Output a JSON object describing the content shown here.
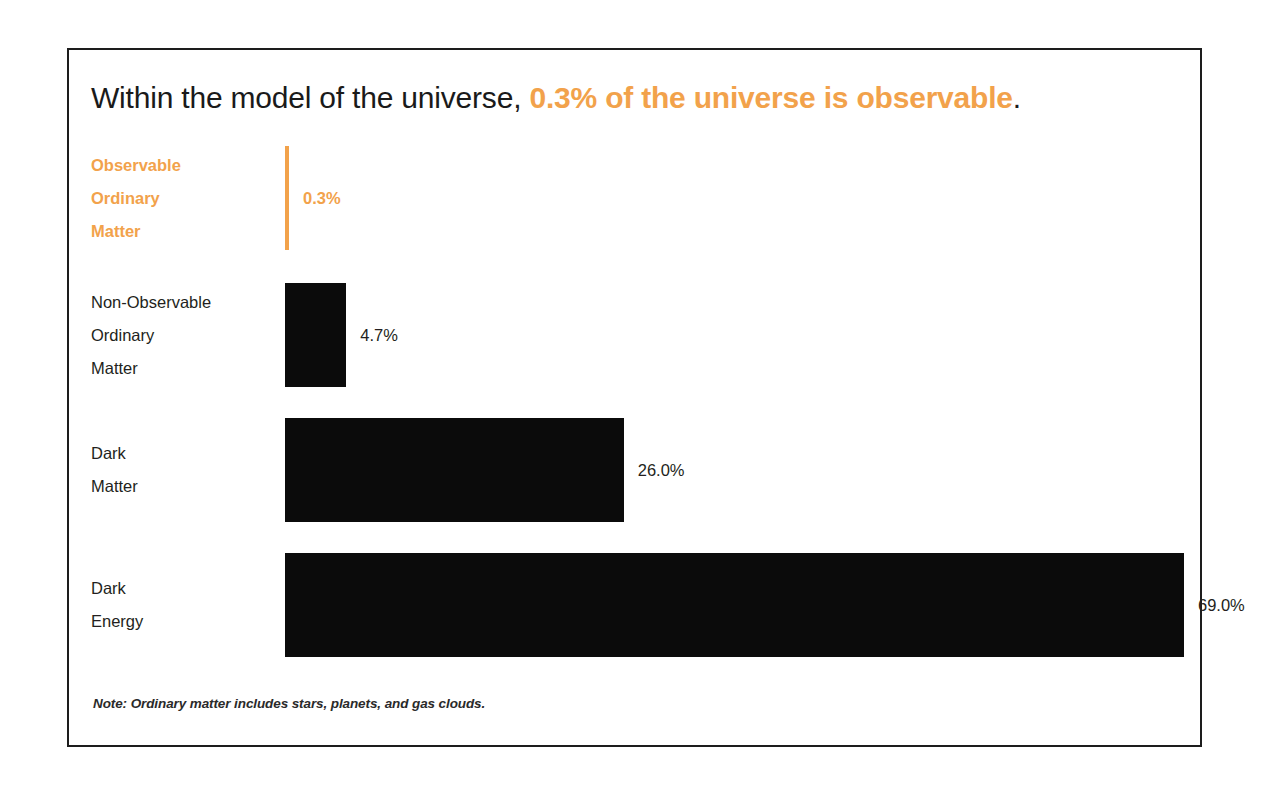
{
  "chart_data": {
    "type": "bar",
    "orientation": "horizontal",
    "title_plain": "Within the model of the universe, 0.3% of the universe is observable.",
    "title_parts": {
      "lead": "Within the model of the universe, ",
      "highlight": "0.3% of the universe is observable",
      "tail": "."
    },
    "categories": [
      "Observable Ordinary Matter",
      "Non-Observable Ordinary Matter",
      "Dark Matter",
      "Dark Energy"
    ],
    "values": [
      0.3,
      4.7,
      26.0,
      69.0
    ],
    "value_labels": [
      "0.3%",
      "4.7%",
      "26.0%",
      "69.0%"
    ],
    "xlabel": "",
    "ylabel": "",
    "xlim": [
      0,
      69
    ],
    "grid": false,
    "legend": "none",
    "note": "Note: Ordinary matter includes stars, planets, and gas clouds.",
    "highlight_index": 0,
    "colors": {
      "highlight": "#F2A24B",
      "bar": "#0B0B0B",
      "label": "#231F20",
      "border": "#1D1D1D",
      "background": "#FFFFFF"
    }
  },
  "rows": [
    {
      "label_lines": [
        "Observable",
        "Ordinary",
        "Matter"
      ],
      "value_label": "0.3%",
      "value": 0.3,
      "highlight": true
    },
    {
      "label_lines": [
        "Non-Observable",
        "Ordinary",
        "Matter"
      ],
      "value_label": "4.7%",
      "value": 4.7,
      "highlight": false
    },
    {
      "label_lines": [
        "Dark",
        "Matter"
      ],
      "value_label": "26.0%",
      "value": 26.0,
      "highlight": false
    },
    {
      "label_lines": [
        "Dark",
        "Energy"
      ],
      "value_label": "69.0%",
      "value": 69.0,
      "highlight": false
    }
  ]
}
